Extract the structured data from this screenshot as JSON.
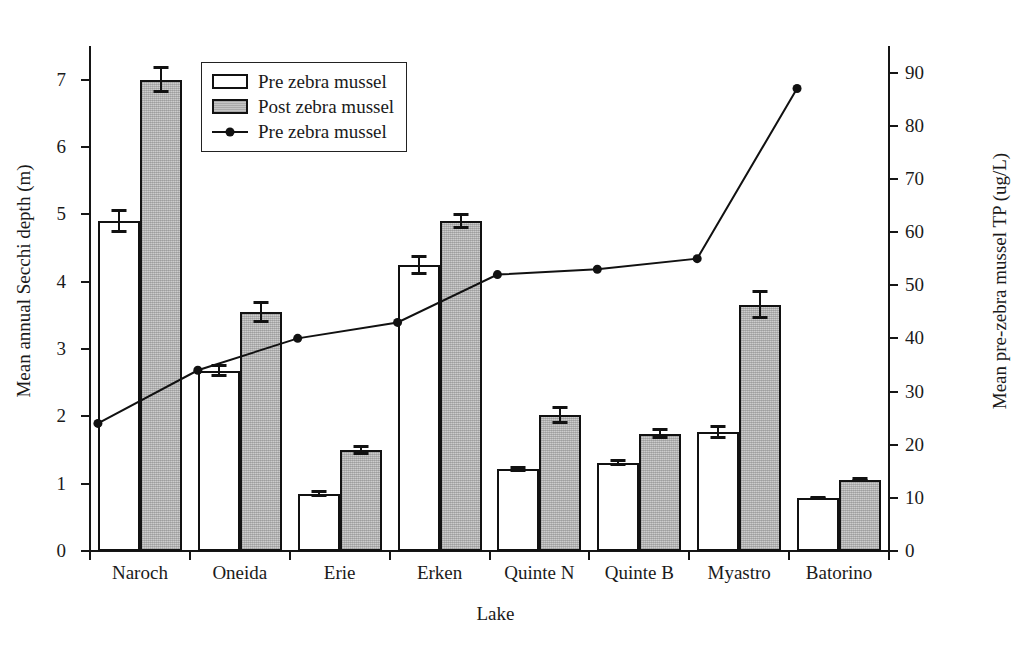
{
  "chart_data": {
    "type": "bar",
    "title": "",
    "xlabel": "Lake",
    "ylabel": "Mean annual Secchi depth (m)",
    "ylabel_right": "Mean pre-zebra mussel TP (ug/L)",
    "categories": [
      "Naroch",
      "Oneida",
      "Erie",
      "Erken",
      "Quinte N",
      "Quinte B",
      "Myastro",
      "Batorino"
    ],
    "ylim": [
      0,
      7.5
    ],
    "yticks": [
      0,
      1,
      2,
      3,
      4,
      5,
      6,
      7
    ],
    "ylim_right": [
      0,
      95
    ],
    "yticks_right": [
      0,
      10,
      20,
      30,
      40,
      50,
      60,
      70,
      80,
      90
    ],
    "grid": false,
    "legend_position": "upper-left-inside",
    "series": [
      {
        "name": "Pre zebra mussel",
        "type": "bar",
        "style": "open-white",
        "axis": "left",
        "values": [
          4.9,
          2.68,
          0.85,
          4.25,
          1.22,
          1.31,
          1.77,
          0.79
        ],
        "errors": [
          0.18,
          0.1,
          0.05,
          0.15,
          0.04,
          0.05,
          0.1,
          0.03
        ]
      },
      {
        "name": "Post zebra mussel",
        "type": "bar",
        "style": "gray-hatched",
        "axis": "left",
        "values": [
          7.0,
          3.55,
          1.5,
          4.9,
          2.02,
          1.74,
          3.66,
          1.06
        ],
        "errors": [
          0.2,
          0.16,
          0.08,
          0.12,
          0.14,
          0.08,
          0.21,
          0.04
        ]
      },
      {
        "name": "Pre zebra mussel",
        "type": "line",
        "style": "line-filled-circle",
        "axis": "right",
        "values": [
          24,
          34,
          40,
          43,
          52,
          53,
          55,
          87
        ]
      }
    ]
  },
  "legend": {
    "items": [
      {
        "label": "Pre zebra mussel",
        "marker": "open-square-swatch"
      },
      {
        "label": "Post zebra mussel",
        "marker": "gray-square-swatch"
      },
      {
        "label": "Pre zebra mussel",
        "marker": "line-dot-marker"
      }
    ]
  },
  "colors": {
    "axis": "#161616",
    "bar_pre_fill": "#ffffff",
    "bar_post_fill": "#bdbdbd",
    "bar_edge": "#111111",
    "line": "#111111",
    "background": "#ffffff"
  }
}
